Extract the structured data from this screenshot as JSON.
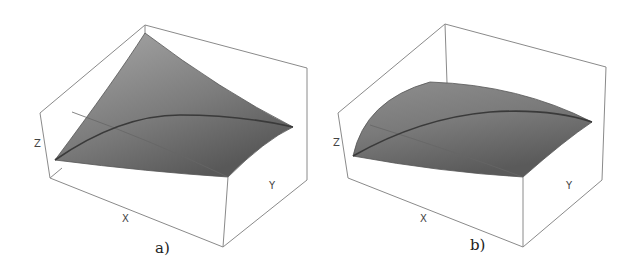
{
  "figure": {
    "panels": [
      {
        "id": "a",
        "caption": "a)",
        "axes": {
          "x": "X",
          "y": "Y",
          "z": "Z"
        },
        "surface": "concave saddle-like surface peaking at back corner"
      },
      {
        "id": "b",
        "caption": "b)",
        "axes": {
          "x": "X",
          "y": "Y",
          "z": "Z"
        },
        "surface": "convex dome-like surface"
      }
    ],
    "colors": {
      "box": "#8a8a8a",
      "surface_light": "#a8a8a8",
      "surface_dark": "#5e5e5e",
      "curve": "#3a3a3a"
    }
  }
}
